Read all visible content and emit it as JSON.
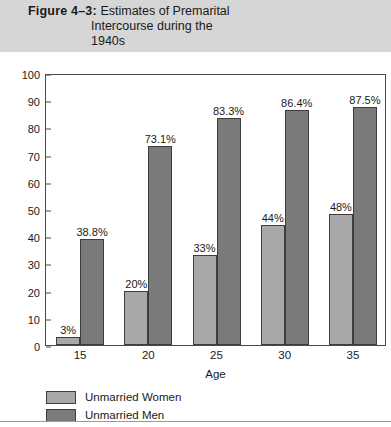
{
  "figure": {
    "number_label": "Figure 4–3:",
    "title_line1": "Estimates of Premarital",
    "title_line2": "Intercourse during the",
    "title_line3": "1940s",
    "band_color": "#d6d6d6"
  },
  "chart_data": {
    "type": "bar",
    "title": "Figure 4–3: Estimates of Premarital Intercourse during the 1940s",
    "xlabel": "Age",
    "ylabel": "Percent",
    "categories": [
      "15",
      "20",
      "25",
      "30",
      "35"
    ],
    "ylim": [
      0,
      100
    ],
    "yticks": [
      "0",
      "10",
      "20",
      "30",
      "40",
      "50",
      "60",
      "70",
      "80",
      "90",
      "100"
    ],
    "grid": false,
    "legend_position": "bottom-left",
    "series": [
      {
        "name": "Unmarried Women",
        "color": "#a8a8a8",
        "values": [
          3,
          20,
          33,
          44,
          48
        ],
        "data_labels": [
          "3%",
          "20%",
          "33%",
          "44%",
          "48%"
        ]
      },
      {
        "name": "Unmarried Men",
        "color": "#7a7a7a",
        "values": [
          38.8,
          73.1,
          83.3,
          86.4,
          87.5
        ],
        "data_labels": [
          "38.8%",
          "73.1%",
          "83.3%",
          "86.4%",
          "87.5%"
        ]
      }
    ]
  }
}
